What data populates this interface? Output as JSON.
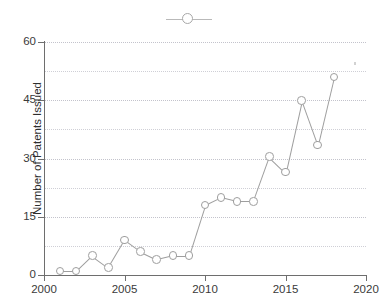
{
  "chart_data": {
    "type": "line",
    "title": "",
    "xlabel": "",
    "ylabel": "Number of Patents Issued",
    "xlim": [
      2000,
      2020
    ],
    "ylim": [
      0,
      60
    ],
    "yticks": [
      0,
      15,
      30,
      45,
      60
    ],
    "ytick_labels": [
      "0",
      "15",
      "30",
      "45",
      "60"
    ],
    "xticks": [
      2000,
      2005,
      2010,
      2015,
      2020
    ],
    "xtick_labels": [
      "2000",
      "2005",
      "2010",
      "2015",
      "2020"
    ],
    "minor_gridlines": [
      7.5,
      22.5,
      37.5,
      52.5
    ],
    "grid": true,
    "legend_position": "top-center",
    "legend_label": "",
    "marker": "open-circle",
    "x": [
      2001,
      2002,
      2003,
      2004,
      2005,
      2006,
      2007,
      2008,
      2009,
      2010,
      2011,
      2012,
      2013,
      2014,
      2015,
      2016,
      2017,
      2018
    ],
    "values": [
      1,
      1,
      5,
      2,
      9,
      6,
      4,
      5,
      5,
      18,
      20,
      19,
      19,
      30.5,
      26.5,
      45,
      33.5,
      51
    ],
    "series": [
      {
        "name": "Patents Issued",
        "color": "#9e9e9e",
        "values": [
          1,
          1,
          5,
          2,
          9,
          6,
          4,
          5,
          5,
          18,
          20,
          19,
          19,
          30.5,
          26.5,
          45,
          33.5,
          51
        ]
      }
    ]
  },
  "axes": {
    "y_title": "Number of Patents Issued",
    "y_labels": [
      "60",
      "45",
      "30",
      "15",
      "0"
    ],
    "x_labels": [
      "2000",
      "2005",
      "2010",
      "2015",
      "2020"
    ]
  },
  "colors": {
    "series": "#9e9e9e",
    "grid": "#cfcfd6",
    "axis": "#6e6e6e",
    "text": "#3a3a3a",
    "background": "#ffffff"
  }
}
